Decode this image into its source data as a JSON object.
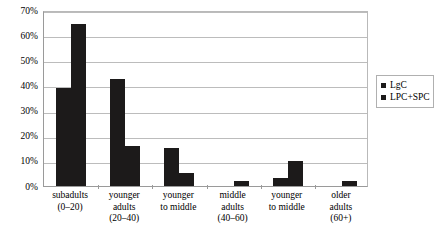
{
  "chart_data": {
    "type": "bar",
    "title": "",
    "subtitle": "",
    "xlabel": "",
    "ylabel": "",
    "ylim": [
      0,
      70
    ],
    "ytick_labels": [
      "0%",
      "10%",
      "20%",
      "30%",
      "40%",
      "50%",
      "60%",
      "70%"
    ],
    "ytick_values": [
      0,
      10,
      20,
      30,
      40,
      50,
      60,
      70
    ],
    "ytick_suffix": "%",
    "grid": true,
    "grid_axis": "y",
    "legend_position": "right",
    "bar_color": "#1C1A1A",
    "categories": [
      "subadults (0-20)",
      "younger adults (20-40)",
      "younger to middle",
      "middle adults (40-60)",
      "younger to middle",
      "older adults (60+)"
    ],
    "category_lines": [
      [
        "subadults",
        "(0–20)"
      ],
      [
        "younger",
        "adults",
        "(20–40)"
      ],
      [
        "younger",
        "to middle"
      ],
      [
        "middle",
        "adults",
        "(40–60)"
      ],
      [
        "younger",
        "to middle"
      ],
      [
        "older",
        "adults",
        "(60+)"
      ]
    ],
    "series": [
      {
        "name": "LgC",
        "values": [
          39,
          42.5,
          15,
          0,
          3,
          0
        ]
      },
      {
        "name": "LPC+SPC",
        "values": [
          64.5,
          16,
          5,
          2,
          10,
          2
        ]
      }
    ]
  },
  "legend": {
    "entries": [
      {
        "label": "LgC",
        "color": "#1C1A1A"
      },
      {
        "label": "LPC+SPC",
        "color": "#1C1A1A"
      }
    ]
  }
}
